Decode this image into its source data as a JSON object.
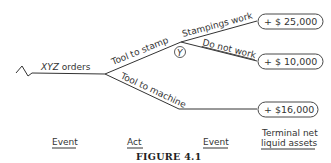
{
  "diagram": {
    "type": "decision-tree",
    "root_event": {
      "label_italic": "XYZ",
      "label_rest": " orders"
    },
    "branches": {
      "act_stamp": {
        "label": "Tool to stamp"
      },
      "act_machine": {
        "label": "Tool to machine"
      },
      "event_node_symbol": "Y",
      "outcome_works": {
        "label": "Stampings work"
      },
      "outcome_not_work": {
        "label": "Do not work"
      }
    },
    "terminal_values": {
      "stamp_works": "+ $ 25,000",
      "stamp_not_work": "+ $ 10,000",
      "machine": "+ $16,000"
    },
    "column_headers": {
      "event1": "Event",
      "act": "Act",
      "event2": "Event",
      "terminal_line1": "Terminal net",
      "terminal_line2": "liquid assets"
    },
    "caption": "FIGURE 4.1"
  }
}
